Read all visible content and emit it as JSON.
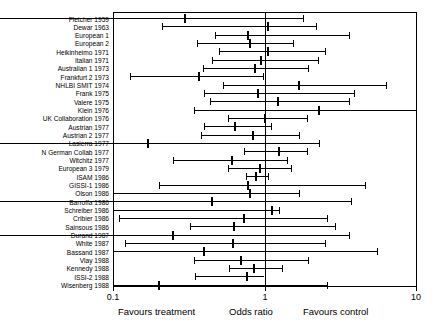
{
  "chart_data": {
    "type": "forest",
    "title": "",
    "xlabel": "Odds ratio",
    "ylabel": "",
    "xscale": "log",
    "xlim": [
      0.1,
      10
    ],
    "xticks": [
      "0.1",
      "1",
      "10"
    ],
    "null_value": 1,
    "grid": false,
    "legend": "none",
    "annotations": {
      "left": "Favours treatment",
      "center": "Odds ratio",
      "right": "Favours control"
    },
    "categories": [
      "Fletcher 1959",
      "Dewar 1963",
      "European 1",
      "European 2",
      "Heikinheimo 1971",
      "Italian 1971",
      "Australian 1 1973",
      "Frankfurt 2 1973",
      "NHLBI SMIT 1974",
      "Frank 1975",
      "Valere 1975",
      "Klein 1976",
      "UK Collaboration 1976",
      "Austrian 1977",
      "Austrian 2 1977",
      "Lasierra 1977",
      "N German Collab 1977",
      "Witchitz 1977",
      "European 3 1979",
      "ISAM 1986",
      "GISSI-1 1986",
      "Olson 1986",
      "Barroffa 1986",
      "Schreiber 1986",
      "Cribier 1986",
      "Sainsous 1986",
      "Durand 1987",
      "White 1987",
      "Bassand 1987",
      "Vlay 1988",
      "Kennedy 1988",
      "ISSI-2 1988",
      "Wisenberg 1988"
    ],
    "points": [
      {
        "study": "Fletcher 1959",
        "or": 0.3,
        "lo": 0.06,
        "hi": 1.8
      },
      {
        "study": "Dewar 1963",
        "or": 1.06,
        "lo": 0.21,
        "hi": 2.2
      },
      {
        "study": "European 1",
        "or": 0.78,
        "lo": 0.47,
        "hi": 3.6
      },
      {
        "study": "European 2",
        "or": 0.8,
        "lo": 0.36,
        "hi": 1.55
      },
      {
        "study": "Heikinheimo 1971",
        "or": 1.05,
        "lo": 0.5,
        "hi": 2.5
      },
      {
        "study": "Italian 1971",
        "or": 0.95,
        "lo": 0.45,
        "hi": 2.25
      },
      {
        "study": "Australian 1 1973",
        "or": 0.86,
        "lo": 0.39,
        "hi": 1.95
      },
      {
        "study": "Frankfurt 2 1973",
        "or": 0.37,
        "lo": 0.13,
        "hi": 0.98
      },
      {
        "study": "NHLBI SMIT 1974",
        "or": 1.7,
        "lo": 0.53,
        "hi": 6.3
      },
      {
        "study": "Frank 1975",
        "or": 0.9,
        "lo": 0.4,
        "hi": 3.9
      },
      {
        "study": "Valere 1975",
        "or": 1.22,
        "lo": 0.44,
        "hi": 3.6
      },
      {
        "study": "Klein 1976",
        "or": 2.3,
        "lo": 0.34,
        "hi": 10.0
      },
      {
        "study": "UK Collaboration 1976",
        "or": 1.0,
        "lo": 0.57,
        "hi": 1.9
      },
      {
        "study": "Austrian 1977",
        "or": 0.64,
        "lo": 0.4,
        "hi": 1.1
      },
      {
        "study": "Austrian 2 1977",
        "or": 0.84,
        "lo": 0.38,
        "hi": 1.7
      },
      {
        "study": "Lasierra 1977",
        "or": 0.17,
        "lo": 0.02,
        "hi": 2.3
      },
      {
        "study": "N German Collab 1977",
        "or": 1.25,
        "lo": 0.73,
        "hi": 1.9
      },
      {
        "study": "Witchitz 1977",
        "or": 0.61,
        "lo": 0.25,
        "hi": 1.4
      },
      {
        "study": "European 3 1979",
        "or": 0.93,
        "lo": 0.57,
        "hi": 1.5
      },
      {
        "study": "ISAM 1986",
        "or": 0.88,
        "lo": 0.76,
        "hi": 1.05
      },
      {
        "study": "GISSI-1 1986",
        "or": 0.78,
        "lo": 0.2,
        "hi": 4.6
      },
      {
        "study": "Olson 1986",
        "or": 0.8,
        "lo": 0.1,
        "hi": 1.7
      },
      {
        "study": "Barroffa 1986",
        "or": 0.45,
        "lo": 0.08,
        "hi": 3.7
      },
      {
        "study": "Schreiber 1986",
        "or": 1.12,
        "lo": 0.1,
        "hi": 1.25
      },
      {
        "study": "Cribier 1986",
        "or": 0.73,
        "lo": 0.11,
        "hi": 2.6
      },
      {
        "study": "Sainsous 1986",
        "or": 0.63,
        "lo": 0.32,
        "hi": 2.9
      },
      {
        "study": "Durand 1987",
        "or": 0.25,
        "lo": 0.09,
        "hi": 3.6
      },
      {
        "study": "White 1987",
        "or": 0.62,
        "lo": 0.12,
        "hi": 2.5
      },
      {
        "study": "Bassand 1987",
        "or": 0.4,
        "lo": 0.1,
        "hi": 5.5
      },
      {
        "study": "Vlay 1988",
        "or": 0.7,
        "lo": 0.34,
        "hi": 1.95
      },
      {
        "study": "Kennedy 1988",
        "or": 0.85,
        "lo": 0.58,
        "hi": 1.3
      },
      {
        "study": "ISSI-2 1988",
        "or": 0.77,
        "lo": 0.35,
        "hi": 1.0
      },
      {
        "study": "Wisenberg 1988",
        "or": 0.2,
        "lo": 0.1,
        "hi": 2.6
      }
    ]
  },
  "axis": {
    "tick_low": "0.1",
    "tick_mid": "1",
    "tick_high": "10",
    "caption_left": "Favours treatment",
    "caption_center": "Odds ratio",
    "caption_right": "Favours control"
  }
}
